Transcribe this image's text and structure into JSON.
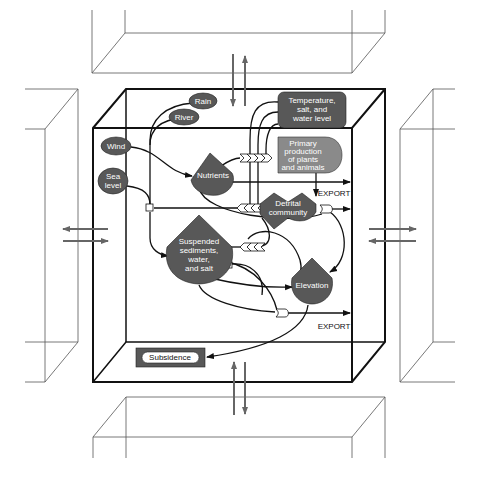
{
  "diagram": {
    "colors": {
      "node_fill": "#585858",
      "primary_fill": "#8a8a8a",
      "line": "#111111",
      "outer_box": "#555555",
      "exchange_arrow": "#666666",
      "label_text": "#ffffff"
    },
    "external_forcings": {
      "rain": "Rain",
      "river": "River",
      "wind": "Wind",
      "sea_level_line1": "Sea",
      "sea_level_line2": "level"
    },
    "nodes": {
      "temperature": [
        "Temperature,",
        "salt, and",
        "water level"
      ],
      "primary_production": [
        "Primary",
        "production",
        "of plants",
        "and animals"
      ],
      "nutrients": "Nutrients",
      "detrital": [
        "Detrital",
        "community"
      ],
      "suspended": [
        "Suspended",
        "sediments,",
        "water,",
        "and salt"
      ],
      "elevation": "Elevation",
      "subsidence": "Subsidence"
    },
    "exports": {
      "export_top": "EXPORT",
      "export_bottom": "EXPORT"
    },
    "adjacent_boxes": [
      "top",
      "left",
      "right",
      "bottom"
    ]
  }
}
